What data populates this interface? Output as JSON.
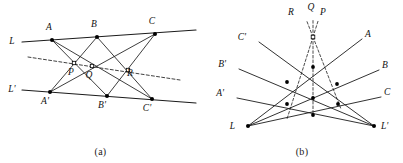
{
  "figure": {
    "captions": {
      "a": "(a)",
      "b": "(b)"
    },
    "stroke_color": "#1b1b1b",
    "dash_color": "#2b2b2b",
    "point_color": "#000000"
  },
  "diagram_a": {
    "name": "two-lines-pappus-line",
    "lines": {
      "L": {
        "label": "L",
        "label_x": 12,
        "label_y": 44,
        "x1": 22,
        "y1": 42,
        "x2": 196,
        "y2": 30
      },
      "L_prime": {
        "label": "L'",
        "label_x": 12,
        "label_y": 92,
        "x1": 22,
        "y1": 90,
        "x2": 196,
        "y2": 103
      }
    },
    "points": [
      {
        "id": "A",
        "label": "A",
        "x": 52,
        "y": 40,
        "label_x": 49,
        "label_y": 30
      },
      {
        "id": "B",
        "label": "B",
        "x": 97,
        "y": 37,
        "label_x": 94,
        "label_y": 27
      },
      {
        "id": "C",
        "label": "C",
        "x": 155,
        "y": 34,
        "label_x": 152,
        "label_y": 24
      },
      {
        "id": "Ap",
        "label": "A'",
        "x": 50,
        "y": 92,
        "label_x": 45,
        "label_y": 104
      },
      {
        "id": "Bp",
        "label": "B'",
        "x": 107,
        "y": 96,
        "label_x": 102,
        "label_y": 108
      },
      {
        "id": "Cp",
        "label": "C'",
        "x": 152,
        "y": 99,
        "label_x": 147,
        "label_y": 111
      },
      {
        "id": "P",
        "label": "P",
        "x": 74,
        "y": 63,
        "label_x": 71,
        "label_y": 75
      },
      {
        "id": "Q",
        "label": "Q",
        "x": 92,
        "y": 66,
        "label_x": 89,
        "label_y": 78
      },
      {
        "id": "R",
        "label": "R",
        "x": 128,
        "y": 70,
        "label_x": 130,
        "label_y": 76
      }
    ],
    "cross_segments": [
      {
        "name": "A-to-Bp",
        "from": "A",
        "to": "Bp"
      },
      {
        "name": "A-to-Cp",
        "from": "A",
        "to": "Cp"
      },
      {
        "name": "B-to-Ap",
        "from": "B",
        "to": "Ap"
      },
      {
        "name": "B-to-Cp",
        "from": "B",
        "to": "Cp"
      },
      {
        "name": "C-to-Ap",
        "from": "C",
        "to": "Ap"
      },
      {
        "name": "C-to-Bp",
        "from": "C",
        "to": "Bp"
      }
    ],
    "pappus_line": {
      "name": "pappus-line-PQR",
      "x1": 28,
      "y1": 57,
      "x2": 180,
      "y2": 80,
      "style": "dashed"
    }
  },
  "diagram_b": {
    "name": "dual-pencil-configuration",
    "vertices": {
      "L": {
        "label": "L",
        "x": 47,
        "y": 126,
        "label_x": 34,
        "label_y": 129
      },
      "Lp": {
        "label": "L'",
        "x": 173,
        "y": 126,
        "label_x": 180,
        "label_y": 129
      }
    },
    "concurrency_point": {
      "name": "point-O",
      "x": 112,
      "y": 37
    },
    "rays_from_L": [
      {
        "id": "A",
        "label": "A",
        "end_x": 161,
        "end_y": 39,
        "label_x": 164,
        "label_y": 37
      },
      {
        "id": "B",
        "label": "B",
        "end_x": 178,
        "end_y": 70,
        "label_x": 181,
        "label_y": 68
      },
      {
        "id": "C",
        "label": "C",
        "end_x": 180,
        "end_y": 97,
        "label_x": 183,
        "label_y": 95
      }
    ],
    "rays_from_Lp": [
      {
        "id": "Cp",
        "label": "C'",
        "end_x": 58,
        "end_y": 42,
        "label_x": 45,
        "label_y": 40
      },
      {
        "id": "Bp",
        "label": "B'",
        "end_x": 38,
        "end_y": 69,
        "label_x": 25,
        "label_y": 67
      },
      {
        "id": "Ap",
        "label": "A'",
        "end_x": 36,
        "end_y": 98,
        "label_x": 23,
        "label_y": 96
      }
    ],
    "dashed_rays": [
      {
        "id": "R",
        "label": "R",
        "label_x": 90,
        "label_y": 15,
        "end_x": 86,
        "end_y": 119
      },
      {
        "id": "Q",
        "label": "Q",
        "label_x": 110,
        "label_y": 10,
        "end_x": 112,
        "end_y": 115
      },
      {
        "id": "P",
        "label": "P",
        "label_x": 122,
        "label_y": 15,
        "end_x": 140,
        "end_y": 109
      }
    ],
    "intersection_points": [
      {
        "name": "node-1",
        "x": 112,
        "y": 67
      },
      {
        "name": "node-2",
        "x": 86,
        "y": 82
      },
      {
        "name": "node-3",
        "x": 136,
        "y": 84
      },
      {
        "name": "node-4",
        "x": 112,
        "y": 98
      },
      {
        "name": "node-5",
        "x": 86,
        "y": 104
      },
      {
        "name": "node-6",
        "x": 137,
        "y": 104
      },
      {
        "name": "node-7",
        "x": 112,
        "y": 115
      }
    ]
  }
}
